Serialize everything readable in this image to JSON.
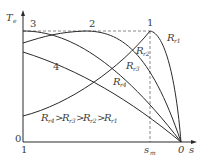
{
  "figure": {
    "y_axis_label": "T",
    "y_axis_label_sub": "e",
    "x_axis_label": "s",
    "y_origin_label": "0",
    "x_left_label": "1",
    "x_right_label": "0",
    "sm_label": "s",
    "sm_label_sub": "m",
    "peak_point_label": "1",
    "curve_numbers": [
      "1",
      "2",
      "3",
      "4"
    ],
    "curve_labels": [
      {
        "main": "R",
        "sub": "r1"
      },
      {
        "main": "R",
        "sub": "r2"
      },
      {
        "main": "R",
        "sub": "r3"
      },
      {
        "main": "R",
        "sub": "r4"
      }
    ],
    "relation": {
      "terms": [
        {
          "main": "R",
          "sub": "r4"
        },
        {
          "main": "R",
          "sub": "r3"
        },
        {
          "main": "R",
          "sub": "r2"
        },
        {
          "main": "R",
          "sub": "r1"
        }
      ],
      "operator": ">"
    },
    "colors": {
      "curve": "#2a2a2a",
      "axis": "#2a2a2a",
      "dashed": "#6a6a6a",
      "text": "#3a3a3a"
    }
  }
}
